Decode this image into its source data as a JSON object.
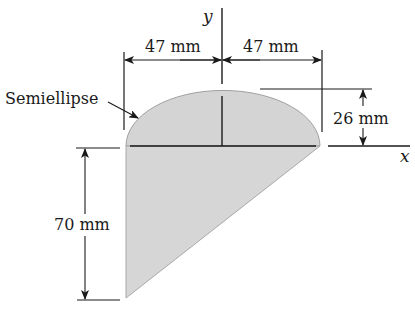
{
  "figure": {
    "type": "cross-section",
    "shape_description": "Semiellipse on top of a right triangle",
    "fill_color": "#d4d4d4",
    "edge_color": "#9a9a9a",
    "line_color": "#1a1a1a"
  },
  "labels": {
    "semiellipse": "Semiellipse",
    "dim_left_width": "47 mm",
    "dim_right_width": "47 mm",
    "dim_height_top": "26 mm",
    "dim_height_bottom": "70 mm",
    "axis_x": "x",
    "axis_y": "y"
  },
  "dimensions": {
    "semi_axis_horizontal_mm": 47,
    "semi_axis_vertical_mm": 26,
    "triangle_height_mm": 70,
    "total_width_mm": 94
  }
}
